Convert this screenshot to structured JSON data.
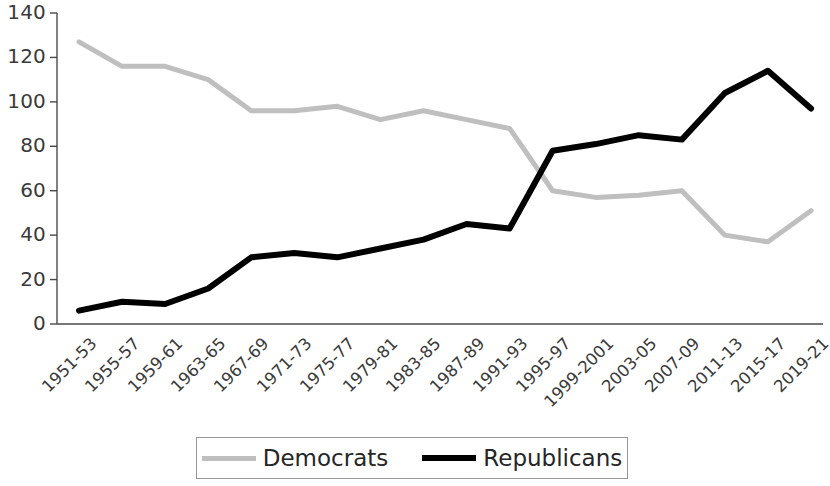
{
  "chart_data": {
    "type": "line",
    "title": "",
    "subtitle": "",
    "xlabel": "",
    "ylabel": "",
    "ylim": [
      0,
      140
    ],
    "ytick_values": [
      0,
      20,
      40,
      60,
      80,
      100,
      120,
      140
    ],
    "ytick_labels": [
      "0",
      "20",
      "40",
      "60",
      "80",
      "100",
      "120",
      "140"
    ],
    "grid": false,
    "legend_position": "bottom",
    "categories": [
      "1951-53",
      "1955-57",
      "1959-61",
      "1963-65",
      "1967-69",
      "1971-73",
      "1975-77",
      "1979-81",
      "1983-85",
      "1987-89",
      "1991-93",
      "1995-97",
      "1999-2001",
      "2003-05",
      "2007-09",
      "2011-13",
      "2015-17",
      "2019-21"
    ],
    "series": [
      {
        "name": "Democrats",
        "color": "#bfbfbf",
        "values": [
          127,
          116,
          116,
          110,
          96,
          96,
          98,
          92,
          96,
          92,
          88,
          60,
          57,
          58,
          60,
          40,
          37,
          51
        ]
      },
      {
        "name": "Republicans",
        "color": "#000000",
        "values": [
          6,
          10,
          9,
          16,
          30,
          32,
          30,
          34,
          38,
          45,
          43,
          78,
          81,
          85,
          83,
          104,
          114,
          97
        ]
      }
    ]
  },
  "legend": {
    "entries": [
      {
        "label": "Democrats"
      },
      {
        "label": "Republicans"
      }
    ]
  }
}
